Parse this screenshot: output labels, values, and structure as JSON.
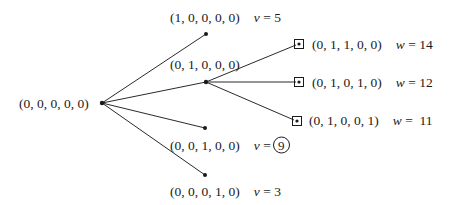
{
  "diagram": {
    "type": "tree",
    "root": {
      "label": "(0, 0, 0, 0, 0)",
      "x": 102,
      "y": 103
    },
    "level1": [
      {
        "label": "(1, 0, 0, 0, 0)",
        "var": "v",
        "eq": "=",
        "value": "5",
        "circled": false,
        "x": 206,
        "y": 34
      },
      {
        "label": "(0, 1, 0, 0, 0)",
        "var": "",
        "eq": "",
        "value": "",
        "circled": false,
        "x": 206,
        "y": 82
      },
      {
        "label": "(0, 0, 1, 0, 0)",
        "var": "v",
        "eq": "=",
        "value": "9",
        "circled": true,
        "x": 205,
        "y": 128
      },
      {
        "label": "(0, 0, 0, 1, 0)",
        "var": "v",
        "eq": "=",
        "value": "3",
        "circled": false,
        "x": 205,
        "y": 175
      }
    ],
    "level2": [
      {
        "parent": "(0, 1, 0, 0, 0)",
        "label": "(0, 1, 1, 0, 0)",
        "var": "w",
        "eq": "=",
        "value": "14",
        "boxed": true,
        "x": 299,
        "y": 44
      },
      {
        "parent": "(0, 1, 0, 0, 0)",
        "label": "(0, 1, 0, 1, 0)",
        "var": "w",
        "eq": "=",
        "value": "12",
        "boxed": true,
        "x": 299,
        "y": 82
      },
      {
        "parent": "(0, 1, 0, 0, 0)",
        "label": "(0, 1, 0, 0, 1)",
        "var": "w",
        "eq": "=",
        "value": "11",
        "boxed": true,
        "x": 297,
        "y": 121
      }
    ]
  },
  "colors": {
    "line": "#2a2a2a",
    "text": "#1a1a1a",
    "background": "#ffffff"
  }
}
